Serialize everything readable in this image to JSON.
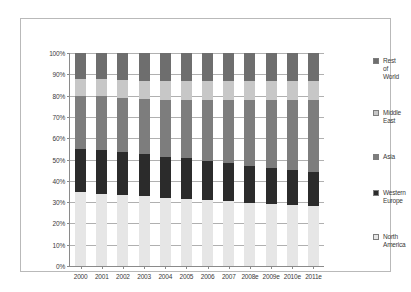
{
  "chart_data": {
    "type": "bar",
    "stacked": true,
    "normalized": true,
    "title": "",
    "subtitle": "",
    "xlabel": "",
    "ylabel": "",
    "ylim": [
      0,
      100
    ],
    "ytick_labels": [
      "100%",
      "90%",
      "80%",
      "70%",
      "60%",
      "50%",
      "40%",
      "30%",
      "20%",
      "10%",
      "0%"
    ],
    "ytick_values": [
      100,
      90,
      80,
      70,
      60,
      50,
      40,
      30,
      20,
      10,
      0
    ],
    "grid": true,
    "legend_position": "right",
    "categories": [
      "2000",
      "2001",
      "2002",
      "2003",
      "2004",
      "2005",
      "2006",
      "2007",
      "2008e",
      "2009e",
      "2010e",
      "2011e"
    ],
    "series": [
      {
        "name": "North America",
        "color": "#e6e6e6",
        "values": [
          34.5,
          34.0,
          33.5,
          33.0,
          32.0,
          31.5,
          31.0,
          30.5,
          29.5,
          29.0,
          28.5,
          28.0
        ]
      },
      {
        "name": "Western Europe",
        "color": "#2b2b2b",
        "values": [
          20.5,
          20.5,
          20.0,
          19.5,
          19.0,
          19.0,
          18.5,
          18.0,
          17.5,
          17.0,
          16.5,
          16.0
        ]
      },
      {
        "name": "Asia",
        "color": "#7d7d7d",
        "values": [
          25.0,
          25.5,
          25.5,
          26.0,
          27.0,
          27.5,
          28.5,
          29.5,
          31.0,
          32.0,
          33.0,
          34.0
        ]
      },
      {
        "name": "Middle East",
        "color": "#c7c7c7",
        "values": [
          8.0,
          8.0,
          8.5,
          8.5,
          9.0,
          9.0,
          9.0,
          9.0,
          9.0,
          9.0,
          9.0,
          9.0
        ]
      },
      {
        "name": "Rest of World",
        "color": "#6e6e6e",
        "values": [
          12.0,
          12.0,
          12.5,
          13.0,
          13.0,
          13.0,
          13.0,
          13.0,
          13.0,
          13.0,
          13.0,
          13.0
        ]
      }
    ],
    "legend_entries": [
      {
        "label": "Rest of World",
        "color": "#6e6e6e"
      },
      {
        "label": "Middle East",
        "color": "#c7c7c7"
      },
      {
        "label": "Asia",
        "color": "#7d7d7d"
      },
      {
        "label": "Western Europe",
        "color": "#2b2b2b"
      },
      {
        "label": "North America",
        "color": "#e6e6e6"
      }
    ]
  },
  "legend": {
    "items": [
      {
        "line1": "Rest",
        "line2": "of",
        "line3": "World"
      },
      {
        "line1": "Middle",
        "line2": "East",
        "line3": ""
      },
      {
        "line1": "Asia",
        "line2": "",
        "line3": ""
      },
      {
        "line1": "Western",
        "line2": "Europe",
        "line3": ""
      },
      {
        "line1": "North",
        "line2": "America",
        "line3": ""
      }
    ]
  },
  "caption": {
    "text": ""
  }
}
